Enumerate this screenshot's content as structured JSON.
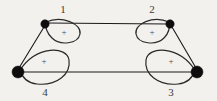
{
  "diagram": {
    "kind": "graph-with-self-loops",
    "background_color": "#f2f1ee",
    "stroke_color": "#1a1a1a",
    "vertex_color": "#0d0d0d",
    "vertices": [
      {
        "id": "v1",
        "label": "1",
        "cx": 45,
        "cy": 24,
        "r": 4.2,
        "label_x": 63,
        "label_y": 10
      },
      {
        "id": "v2",
        "label": "2",
        "cx": 170,
        "cy": 24,
        "r": 4.2,
        "label_x": 152,
        "label_y": 10
      },
      {
        "id": "v3",
        "label": "3",
        "cx": 197,
        "cy": 72,
        "r": 6.0,
        "label_x": 171,
        "label_y": 93
      },
      {
        "id": "v4",
        "label": "4",
        "cx": 18,
        "cy": 72,
        "r": 6.0,
        "label_x": 45,
        "label_y": 93
      }
    ],
    "edges": [
      {
        "id": "e-1-2",
        "from": "v1",
        "to": "v2",
        "path": "M 47 23 L 168 24"
      },
      {
        "id": "e-4-3",
        "from": "v4",
        "to": "v3",
        "path": "M 20 72 L 195 72"
      },
      {
        "id": "e-1-4",
        "from": "v1",
        "to": "v4",
        "path": "M 44 27 L 19 68"
      },
      {
        "id": "e-2-3",
        "from": "v2",
        "to": "v3",
        "path": "M 172 27 L 196 68"
      }
    ],
    "loops": [
      {
        "id": "loop-1",
        "at": "v1",
        "sign": "+",
        "sign_x": 64,
        "sign_y": 33,
        "path": "M 46 22 C 62 15, 82 24, 80 34 C 78 44, 60 46, 52 38 C 47 33, 45 27, 46 22 Z"
      },
      {
        "id": "loop-2",
        "at": "v2",
        "sign": "+",
        "sign_x": 152,
        "sign_y": 33,
        "path": "M 169 22 C 153 15, 134 24, 136 34 C 138 44, 156 46, 164 38 C 169 33, 170 27, 169 22 Z"
      },
      {
        "id": "loop-3",
        "at": "v3",
        "sign": "+",
        "sign_x": 171,
        "sign_y": 62,
        "path": "M 195 70 C 178 45, 148 46, 146 60 C 144 74, 158 86, 178 84 C 188 83, 193 77, 195 70 Z"
      },
      {
        "id": "loop-4",
        "at": "v4",
        "sign": "+",
        "sign_x": 44,
        "sign_y": 62,
        "path": "M 20 70 C 37 45, 67 46, 69 60 C 71 74, 57 86, 37 84 C 27 83, 22 77, 20 70 Z"
      }
    ]
  }
}
